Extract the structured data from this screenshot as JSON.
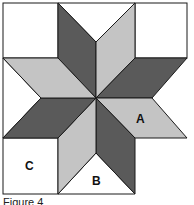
{
  "figure": {
    "caption": "Figure 4",
    "colors": {
      "dark": "#5a5a5a",
      "light": "#c4c4c4",
      "white": "#ffffff",
      "stroke": "#1a1a1a"
    },
    "labels": {
      "A": "A",
      "B": "B",
      "C": "C"
    },
    "pieces": [
      {
        "name": "diamond-top-left",
        "shade": "dark"
      },
      {
        "name": "diamond-top-right",
        "shade": "light"
      },
      {
        "name": "diamond-right-upper",
        "shade": "dark"
      },
      {
        "name": "diamond-right-lower",
        "shade": "light",
        "label": "A"
      },
      {
        "name": "diamond-bottom-right",
        "shade": "dark"
      },
      {
        "name": "diamond-bottom-left",
        "shade": "light"
      },
      {
        "name": "diamond-left-lower",
        "shade": "dark"
      },
      {
        "name": "diamond-left-upper",
        "shade": "light"
      },
      {
        "name": "corner-square",
        "shade": "white",
        "label": "C"
      },
      {
        "name": "side-triangle",
        "shade": "white",
        "label": "B"
      }
    ]
  }
}
